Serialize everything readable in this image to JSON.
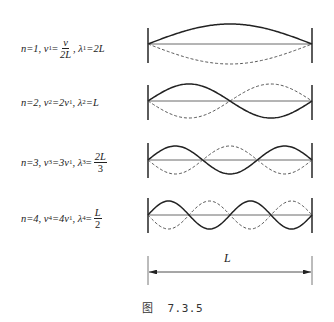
{
  "figure": {
    "caption_prefix": "图",
    "caption_number": "7.3.5",
    "dimension_label": "L",
    "colors": {
      "ink": "#222222",
      "background": "#ffffff"
    },
    "modes": [
      {
        "n_text": "n=1,",
        "nu_sym": "ν",
        "nu_sub": "1",
        "nu_eq": "=",
        "nu_frac_num": "v",
        "nu_frac_den": "2L",
        "sep": ",",
        "lambda_sym": "λ",
        "lambda_sub": "1",
        "lambda_eq": "=2L",
        "harmonic": 1
      },
      {
        "n_text": "n=2,",
        "nu_sym": "ν",
        "nu_sub": "2",
        "nu_eq": "=2ν",
        "nu_eq_sub": "1",
        "sep": ",",
        "lambda_sym": "λ",
        "lambda_sub": "2",
        "lambda_eq": "=L",
        "harmonic": 2
      },
      {
        "n_text": "n=3,",
        "nu_sym": "ν",
        "nu_sub": "3",
        "nu_eq": "=3ν",
        "nu_eq_sub": "1",
        "sep": ",",
        "lambda_sym": "λ",
        "lambda_sub": "3",
        "lambda_eq": "=",
        "lambda_frac_num": "2L",
        "lambda_frac_den": "3",
        "harmonic": 3
      },
      {
        "n_text": "n=4,",
        "nu_sym": "ν",
        "nu_sub": "4",
        "nu_eq": "=4ν",
        "nu_eq_sub": "1",
        "sep": ",",
        "lambda_sym": "λ",
        "lambda_sub": "4",
        "lambda_eq": "=",
        "lambda_frac_num": "L",
        "lambda_frac_den": "2",
        "harmonic": 4
      }
    ]
  }
}
